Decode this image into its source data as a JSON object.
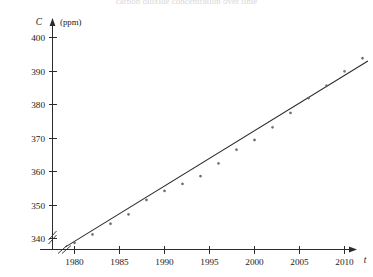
{
  "figure": {
    "partial_header_text": "carbon dioxide concentration over time",
    "y_axis": {
      "variable": "C",
      "unit": "(ppm)",
      "ticks": [
        400,
        390,
        380,
        370,
        360,
        350,
        340
      ],
      "has_break": true
    },
    "x_axis": {
      "variable": "t",
      "ticks": [
        1980,
        1985,
        1990,
        1995,
        2000,
        2005,
        2010
      ],
      "has_break": true
    },
    "colors": {
      "axis": "#2b2b2b",
      "point": "#6f6f6f",
      "line": "#2b2b2b",
      "background": "#ffffff"
    }
  },
  "chart_data": {
    "type": "scatter",
    "title": "",
    "subtitle": "",
    "xlabel": "t",
    "ylabel": "C (ppm)",
    "xunit": "year",
    "yunit": "ppm",
    "grid": false,
    "legend": false,
    "legend_position": "none",
    "xlim": [
      1978.5,
      2013
    ],
    "ylim": [
      336,
      401
    ],
    "xticks": [
      1980,
      1985,
      1990,
      1995,
      2000,
      2005,
      2010
    ],
    "yticks": [
      340,
      350,
      360,
      370,
      380,
      390,
      400
    ],
    "axis_break_x": true,
    "axis_break_y": true,
    "series": [
      {
        "name": "Observed CO2 concentration",
        "marker": "dot",
        "x": [
          1980,
          1982,
          1984,
          1986,
          1988,
          1990,
          1992,
          1994,
          1996,
          1998,
          2000,
          2002,
          2004,
          2006,
          2008,
          2010,
          2012
        ],
        "y": [
          338.7,
          341.2,
          344.4,
          347.2,
          351.5,
          354.2,
          356.3,
          358.6,
          362.4,
          366.5,
          369.4,
          373.2,
          377.5,
          381.9,
          385.6,
          389.9,
          393.8
        ]
      },
      {
        "name": "Linear regression line",
        "type": "line",
        "x": [
          1979.0,
          2012.6
        ],
        "y": [
          337.5,
          393.0
        ],
        "slope_ppm_per_year": 1.65,
        "intercept_ppm_at_1979": 337.5
      }
    ]
  }
}
